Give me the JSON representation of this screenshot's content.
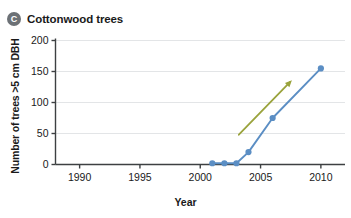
{
  "panel": {
    "badge": "C",
    "title": "Cottonwood trees"
  },
  "chart_data": {
    "type": "line",
    "title": "Cottonwood trees",
    "xlabel": "Year",
    "ylabel": "Number of trees >5 cm DBH",
    "xlim": [
      1988,
      2012
    ],
    "ylim": [
      0,
      200
    ],
    "xticks": [
      1990,
      1995,
      2000,
      2005,
      2010
    ],
    "xtick_labels": [
      "1990",
      "1995",
      "2000",
      "2005",
      "2010"
    ],
    "yticks": [
      0,
      50,
      100,
      150,
      200
    ],
    "ytick_labels": [
      "0",
      "50",
      "100",
      "150",
      "200"
    ],
    "grid": "horizontal",
    "legend": "none",
    "series": [
      {
        "name": "Cottonwood trees",
        "color": "#5b8ec4",
        "marker": "circle",
        "x": [
          2001,
          2002,
          2003,
          2004,
          2006,
          2010
        ],
        "values": [
          2,
          2,
          2,
          20,
          75,
          155
        ]
      }
    ],
    "annotations": [
      {
        "type": "arrow",
        "color": "#9aa33c",
        "x_start": 2003.2,
        "y_start": 48,
        "x_end": 2007.6,
        "y_end": 136
      }
    ]
  },
  "colors": {
    "line": "#5b8ec4",
    "arrow": "#9aa33c",
    "grid": "#e3e5e7",
    "axis": "#3d4042",
    "badge": "#6c7176",
    "text": "#1a1a1a"
  }
}
